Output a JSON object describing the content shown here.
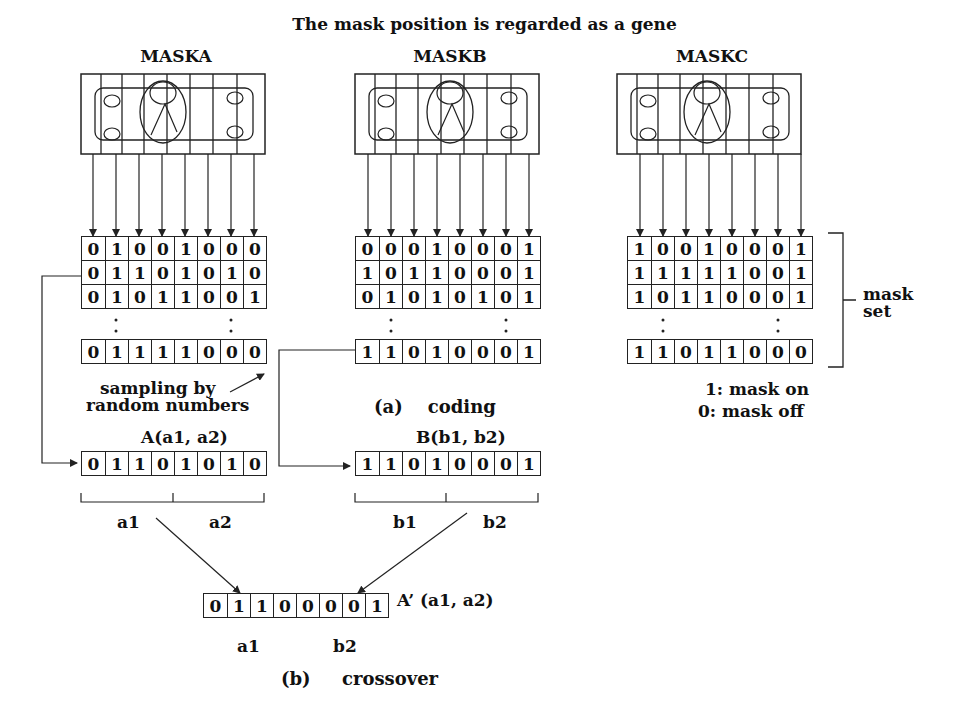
{
  "title": "The  mask position is regarded as a gene",
  "masks": [
    {
      "label": "MASKA",
      "rows": [
        [
          0,
          1,
          0,
          0,
          1,
          0,
          0,
          0
        ],
        [
          0,
          1,
          1,
          0,
          1,
          0,
          1,
          0
        ],
        [
          0,
          1,
          0,
          1,
          1,
          0,
          0,
          1
        ]
      ],
      "last_row": [
        0,
        1,
        1,
        1,
        1,
        0,
        0,
        0
      ]
    },
    {
      "label": "MASKB",
      "rows": [
        [
          0,
          0,
          0,
          1,
          0,
          0,
          0,
          1
        ],
        [
          1,
          0,
          1,
          1,
          0,
          0,
          0,
          1
        ],
        [
          0,
          1,
          0,
          1,
          0,
          1,
          0,
          1
        ]
      ],
      "last_row": [
        1,
        1,
        0,
        1,
        0,
        0,
        0,
        1
      ]
    },
    {
      "label": "MASKC",
      "rows": [
        [
          1,
          0,
          0,
          1,
          0,
          0,
          0,
          1
        ],
        [
          1,
          1,
          1,
          1,
          1,
          0,
          0,
          1
        ],
        [
          1,
          0,
          1,
          1,
          0,
          0,
          0,
          1
        ]
      ],
      "last_row": [
        1,
        1,
        0,
        1,
        1,
        0,
        0,
        0
      ]
    }
  ],
  "mask_set_label_line1": "mask",
  "mask_set_label_line2": "set",
  "legend_on": "1: mask on",
  "legend_off": "0: mask off",
  "sampling_line1": "sampling by",
  "sampling_line2": "random numbers",
  "coding_caption": "(a)    coding",
  "parent_a": {
    "label": "A(a1, a2)",
    "bits": [
      0,
      1,
      1,
      0,
      1,
      0,
      1,
      0
    ],
    "left_part": "a1",
    "right_part": "a2"
  },
  "parent_b": {
    "label": "B(b1, b2)",
    "bits": [
      1,
      1,
      0,
      1,
      0,
      0,
      0,
      1
    ],
    "left_part": "b1",
    "right_part": "b2"
  },
  "child": {
    "label": "A’ (a1, a2)",
    "bits": [
      0,
      1,
      1,
      0,
      0,
      0,
      0,
      1
    ],
    "left_part": "a1",
    "right_part": "b2"
  },
  "crossover_caption": "(b)     crossover"
}
